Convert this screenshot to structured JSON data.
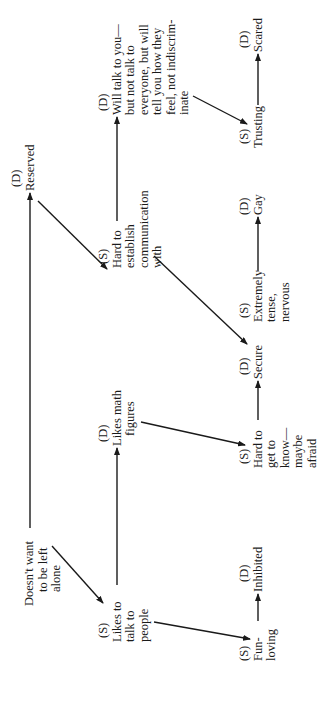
{
  "diagram": {
    "orientation": "rotated-90-ccw",
    "legend": {
      "S": "(S)",
      "D": "(D)"
    },
    "nodes": {
      "root": {
        "tag": "",
        "lines": [
          "Doesn't want",
          "to be left",
          "alone"
        ]
      },
      "reserved": {
        "tag": "(D)",
        "lines": [
          "Reserved"
        ]
      },
      "hard_comm": {
        "tag": "(S)",
        "lines": [
          "Hard to",
          "establish",
          "communication",
          "with"
        ]
      },
      "will_talk": {
        "tag": "(D)",
        "lines": [
          "Will talk to you—",
          "but not talk to",
          "everyone, but will",
          "tell you how they",
          "feel, not indiscrim-",
          "inate"
        ]
      },
      "trusting": {
        "tag": "(S)",
        "lines": [
          "Trusting"
        ]
      },
      "scared": {
        "tag": "(D)",
        "lines": [
          "Scared"
        ]
      },
      "tense": {
        "tag": "(S)",
        "lines": [
          "Extremely",
          "tense,",
          "nervous"
        ]
      },
      "gay": {
        "tag": "(D)",
        "lines": [
          "Gay"
        ]
      },
      "likes_talk": {
        "tag": "(S)",
        "lines": [
          "Likes to",
          "talk to",
          "people"
        ]
      },
      "likes_math": {
        "tag": "(D)",
        "lines": [
          "Likes math",
          "figures"
        ]
      },
      "hard_know": {
        "tag": "(S)",
        "lines": [
          "Hard to",
          "get to",
          "know—",
          "maybe",
          "afraid"
        ]
      },
      "secure": {
        "tag": "(D)",
        "lines": [
          "Secure"
        ]
      },
      "fun_loving": {
        "tag": "(S)",
        "lines": [
          "Fun-",
          "loving"
        ]
      },
      "inhibited": {
        "tag": "(D)",
        "lines": [
          "Inhibited"
        ]
      }
    },
    "edges": [
      {
        "from": "root",
        "to": "reserved"
      },
      {
        "from": "root",
        "to": "likes_talk"
      },
      {
        "from": "reserved",
        "to": "hard_comm"
      },
      {
        "from": "hard_comm",
        "to": "will_talk"
      },
      {
        "from": "hard_comm",
        "to": "tense"
      },
      {
        "from": "will_talk",
        "to": "trusting"
      },
      {
        "from": "trusting",
        "to": "scared"
      },
      {
        "from": "tense",
        "to": "gay"
      },
      {
        "from": "likes_talk",
        "to": "likes_math"
      },
      {
        "from": "likes_talk",
        "to": "fun_loving"
      },
      {
        "from": "likes_math",
        "to": "hard_know"
      },
      {
        "from": "hard_know",
        "to": "secure"
      },
      {
        "from": "fun_loving",
        "to": "inhibited"
      }
    ],
    "colors": {
      "ink": "#1a1a1a",
      "background": "#ffffff"
    }
  }
}
